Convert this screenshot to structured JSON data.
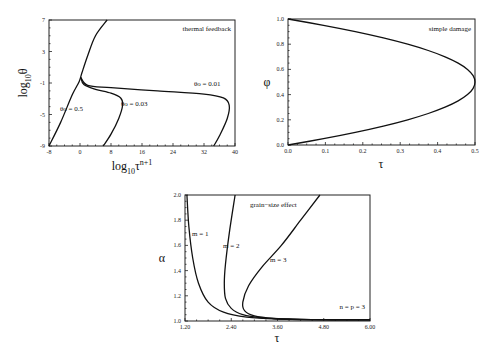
{
  "chart_data": [
    {
      "type": "line",
      "title": "thermal feedback",
      "xlabel": "log10 τ^(n+1)",
      "ylabel": "log10 θ",
      "xlim": [
        -8,
        40
      ],
      "ylim": [
        -9,
        7
      ],
      "xticks": [
        "-8",
        "0",
        "8",
        "16",
        "24",
        "32",
        "40"
      ],
      "yticks": [
        "-9",
        "-5",
        "-1",
        "3",
        "7"
      ],
      "grid": false,
      "series": [
        {
          "name": "θo = 0.5",
          "x": [
            -8,
            -5,
            -2,
            -0.2,
            0.5,
            2,
            4,
            7
          ],
          "y": [
            -9,
            -6,
            -2.5,
            -0.8,
            0.3,
            2.5,
            5,
            7
          ]
        },
        {
          "name": "θo = 0.03",
          "x": [
            0.2,
            1,
            4,
            8,
            10.5,
            11,
            10,
            8,
            6
          ],
          "y": [
            -0.3,
            -1.2,
            -1.8,
            -2.3,
            -2.9,
            -3.8,
            -5.5,
            -7.5,
            -9
          ]
        },
        {
          "name": "θo = 0.01",
          "x": [
            0.2,
            2,
            8,
            20,
            32,
            37,
            38.5,
            38,
            36,
            34.5
          ],
          "y": [
            -0.3,
            -1.3,
            -1.6,
            -2.0,
            -2.4,
            -2.9,
            -3.8,
            -5.5,
            -7.7,
            -9
          ]
        }
      ],
      "annotations": [
        "θo = 0.5",
        "θo = 0.03",
        "θo = 0.01",
        "thermal feedback"
      ]
    },
    {
      "type": "line",
      "title": "simple damage",
      "xlabel": "τ",
      "ylabel": "φ",
      "xlim": [
        0,
        0.5
      ],
      "ylim": [
        0,
        1
      ],
      "xticks": [
        "0.0",
        "0.1",
        "0.2",
        "0.3",
        "0.4",
        "0.5"
      ],
      "yticks": [
        "0.0",
        "0.2",
        "0.4",
        "0.6",
        "0.8",
        "1.0"
      ],
      "grid": false,
      "series": [
        {
          "name": "τ = 2φ(1−φ)",
          "x": [
            0,
            0.095,
            0.18,
            0.255,
            0.32,
            0.375,
            0.42,
            0.455,
            0.48,
            0.495,
            0.5,
            0.495,
            0.48,
            0.455,
            0.42,
            0.375,
            0.32,
            0.255,
            0.18,
            0.095,
            0
          ],
          "y": [
            0,
            0.05,
            0.1,
            0.15,
            0.2,
            0.25,
            0.3,
            0.35,
            0.4,
            0.45,
            0.5,
            0.55,
            0.6,
            0.65,
            0.7,
            0.75,
            0.8,
            0.85,
            0.9,
            0.95,
            1.0
          ]
        }
      ],
      "annotations": [
        "simple damage"
      ]
    },
    {
      "type": "line",
      "title": "grain-size effect",
      "xlabel": "τ",
      "ylabel": "α",
      "xlim": [
        1.2,
        6.0
      ],
      "ylim": [
        1.0,
        2.0
      ],
      "xticks": [
        "1.20",
        "2.40",
        "3.60",
        "4.80",
        "6.00"
      ],
      "yticks": [
        "1.0",
        "1.2",
        "1.4",
        "1.6",
        "1.8",
        "2.0"
      ],
      "grid": false,
      "series": [
        {
          "name": "m = 1",
          "x": [
            1.25,
            1.3,
            1.4,
            1.55,
            1.8,
            2.2,
            2.8,
            3.6,
            4.8,
            6.0
          ],
          "y": [
            2.0,
            1.75,
            1.5,
            1.3,
            1.15,
            1.07,
            1.03,
            1.015,
            1.01,
            1.01
          ]
        },
        {
          "name": "m = 2",
          "x": [
            2.5,
            2.35,
            2.25,
            2.22,
            2.25,
            2.4,
            2.7,
            3.2,
            4.0,
            5.0,
            6.0
          ],
          "y": [
            2.0,
            1.7,
            1.45,
            1.3,
            1.18,
            1.1,
            1.05,
            1.025,
            1.015,
            1.01,
            1.01
          ]
        },
        {
          "name": "m = 3",
          "x": [
            4.7,
            4.2,
            3.7,
            3.2,
            2.85,
            2.7,
            2.75,
            3.0,
            3.5,
            4.2,
            5.0,
            6.0
          ],
          "y": [
            2.0,
            1.8,
            1.6,
            1.43,
            1.28,
            1.15,
            1.08,
            1.04,
            1.02,
            1.012,
            1.01,
            1.01
          ]
        }
      ],
      "annotations": [
        "grain-size effect",
        "m = 1",
        "m = 2",
        "m = 3",
        "n = p = 3"
      ]
    }
  ],
  "panels": {
    "thermal": {
      "title": "thermal feedback",
      "ylabel_main": "log",
      "ylabel_sub": "10",
      "ylabel_var": "θ",
      "xlabel_main": "log",
      "xlabel_sub": "10",
      "xlabel_var": "τ",
      "xlabel_sup": "n+1",
      "labels": {
        "a": "θo = 0.5",
        "b": "θo = 0.03",
        "c": "θo = 0.01"
      }
    },
    "damage": {
      "title": "simple damage",
      "xlabel": "τ",
      "ylabel": "φ"
    },
    "grain": {
      "title": "grain−size effect",
      "xlabel": "τ",
      "ylabel": "α",
      "labels": {
        "m1": "m = 1",
        "m2": "m = 2",
        "m3": "m = 3",
        "np": "n = p = 3"
      }
    }
  }
}
